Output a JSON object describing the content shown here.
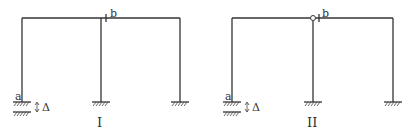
{
  "figures": [
    {
      "id": "I",
      "caption": "I",
      "labels": {
        "a": "a",
        "b": "b",
        "delta": "Δ"
      },
      "hinge_at_b": false,
      "geometry": {
        "x_left": 22,
        "x_mid": 101,
        "x_right": 180,
        "y_top": 18,
        "y_base": 102
      }
    },
    {
      "id": "II",
      "caption": "II",
      "labels": {
        "a": "a",
        "b": "b",
        "delta": "Δ"
      },
      "hinge_at_b": true,
      "geometry": {
        "x_left": 232,
        "x_mid": 313,
        "x_right": 393,
        "y_top": 18,
        "y_base": 102
      }
    }
  ]
}
